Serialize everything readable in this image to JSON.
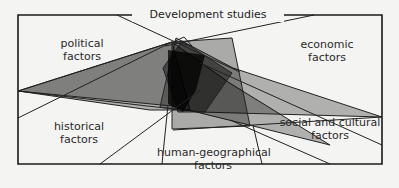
{
  "diagram": {
    "title": "Development studies",
    "colors": {
      "background": "#f4f4f2",
      "frame": "#1a1a1a",
      "shape_fill": "#000000",
      "line": "#222222"
    },
    "nodes": [
      {
        "id": "political",
        "line1": "political",
        "line2": "factors",
        "position": "top-left"
      },
      {
        "id": "economic",
        "line1": "economic",
        "line2": "factors",
        "position": "top-right"
      },
      {
        "id": "historical",
        "line1": "historical",
        "line2": "factors",
        "position": "bottom-left"
      },
      {
        "id": "social",
        "line1": "social and cultural",
        "line2": "factors",
        "position": "bottom-right"
      },
      {
        "id": "human_geo",
        "line1": "human-geographical",
        "line2": "factors",
        "position": "bottom-center"
      }
    ]
  }
}
